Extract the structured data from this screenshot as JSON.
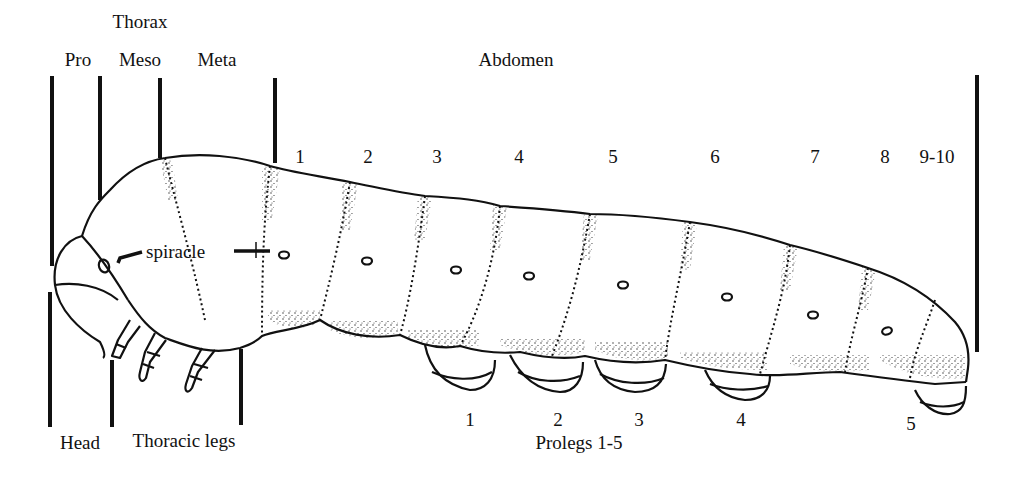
{
  "diagram": {
    "type": "labeled-anatomy",
    "colors": {
      "ink": "#111111",
      "background": "#ffffff"
    }
  },
  "labels": {
    "thorax": "Thorax",
    "pro": "Pro",
    "meso": "Meso",
    "meta": "Meta",
    "abdomen": "Abdomen",
    "spiracle": "spiracle",
    "head": "Head",
    "thoracic_legs": "Thoracic legs",
    "prolegs": "Prolegs 1-5"
  },
  "abdominal_segments": [
    "1",
    "2",
    "3",
    "4",
    "5",
    "6",
    "7",
    "8",
    "9-10"
  ],
  "proleg_numbers": [
    "1",
    "2",
    "3",
    "4",
    "5"
  ]
}
